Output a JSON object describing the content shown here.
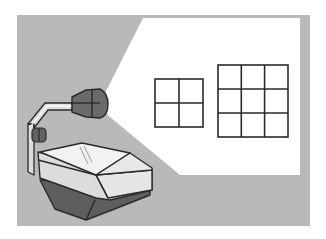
{
  "illustration": {
    "subject": "overhead-projector",
    "colors": {
      "background": "#ffffff",
      "panel": "#b9b9b9",
      "light_beam": "#ffffff",
      "outline": "#2a2a2a",
      "projector_light": "#e4e4e4",
      "projector_top": "#f2f2f2",
      "projector_dark": "#5e5e5e",
      "lens_head": "#6a6a6a",
      "arm": "#d6d6d6"
    },
    "projected_grids": [
      {
        "name": "small-grid",
        "rows": 2,
        "cols": 2
      },
      {
        "name": "large-grid",
        "rows": 3,
        "cols": 3
      }
    ]
  }
}
